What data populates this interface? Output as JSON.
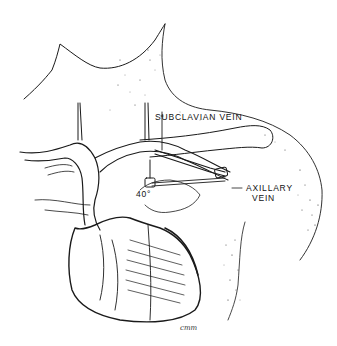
{
  "figure": {
    "type": "anatomical line illustration",
    "colors": {
      "ink": "#1a1a1a",
      "background": "#ffffff",
      "stipple": "#333333"
    }
  },
  "labels": {
    "subclavian": "SUBCLAVIAN VEIN",
    "axillary_line1": "AXILLARY",
    "axillary_line2": "VEIN",
    "angle": "40°"
  },
  "signature": "cmm"
}
